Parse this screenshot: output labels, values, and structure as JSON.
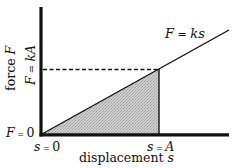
{
  "diagram": {
    "type": "force-displacement graph (spring work)",
    "colors": {
      "axis": "#111111",
      "line": "#111111",
      "shade": "#c9c9c9",
      "background": "#ffffff"
    },
    "labels": {
      "curve": "F = ks",
      "y_axis": "force F",
      "y_tick_top": "F = kA",
      "y_tick_origin": "F = 0",
      "x_tick_origin": "s = 0",
      "x_tick_A": "s = A",
      "x_axis": "displacement s"
    },
    "label_parts": {
      "curve_lhs": "F",
      "curve_eq": " = ",
      "curve_rhs": "ks",
      "y_axis_word": "force ",
      "y_axis_var": "F",
      "y_tick_top_lhs": "F",
      "y_tick_top_eq": " = ",
      "y_tick_top_rhs": "kA",
      "y_origin_lhs": "F",
      "y_origin_eq": " = ",
      "y_origin_rhs": "0",
      "x_origin_lhs": "s",
      "x_origin_eq": " = ",
      "x_origin_rhs": "0",
      "x_A_lhs": "s",
      "x_A_eq": " = ",
      "x_A_rhs": "A",
      "x_axis_word": "displacement ",
      "x_axis_var": "s"
    },
    "elements": [
      "vertical y-axis (thick)",
      "horizontal x-axis (thick)",
      "straight line F = ks from origin",
      "dashed horizontal line at F = kA",
      "vertical line at s = A",
      "shaded triangle under line from s=0 to s=A (work done)"
    ]
  }
}
